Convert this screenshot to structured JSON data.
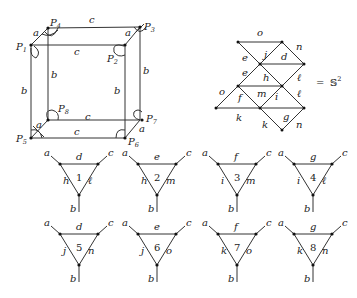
{
  "cube": {
    "points": [
      "P1",
      "P2",
      "P3",
      "P4",
      "P5",
      "P6",
      "P7",
      "P8"
    ],
    "edge_labels": {
      "top_back": "c",
      "top_front": "c",
      "bottom_back": "c",
      "bottom_front": "c",
      "left_front": "b",
      "left_back": "b",
      "right_front": "b",
      "right_back": "b",
      "corner_a": "a"
    }
  },
  "complex": {
    "labels": [
      "o",
      "n",
      "j",
      "d",
      "e",
      "e",
      "h",
      "ℓ",
      "ℓ",
      "o",
      "m",
      "i",
      "f",
      "k",
      "g",
      "k",
      "n"
    ],
    "equals": "=",
    "sphere": "𝕊",
    "sphere_exp": "2"
  },
  "triangles": [
    {
      "num": "1",
      "top": "d",
      "left": "h",
      "right": "ℓ",
      "a": "a",
      "b": "b",
      "c": "c"
    },
    {
      "num": "2",
      "top": "e",
      "left": "h",
      "right": "m",
      "a": "a",
      "b": "b",
      "c": "c"
    },
    {
      "num": "3",
      "top": "f",
      "left": "i",
      "right": "m",
      "a": "a",
      "b": "b",
      "c": "c"
    },
    {
      "num": "4",
      "top": "g",
      "left": "i",
      "right": "ℓ",
      "a": "a",
      "b": "b",
      "c": "c"
    },
    {
      "num": "5",
      "top": "d",
      "left": "j",
      "right": "n",
      "a": "a",
      "b": "b",
      "c": "c"
    },
    {
      "num": "6",
      "top": "e",
      "left": "j",
      "right": "o",
      "a": "a",
      "b": "b",
      "c": "c"
    },
    {
      "num": "7",
      "top": "f",
      "left": "k",
      "right": "o",
      "a": "a",
      "b": "b",
      "c": "c"
    },
    {
      "num": "8",
      "top": "g",
      "left": "k",
      "right": "n",
      "a": "a",
      "b": "b",
      "c": "c"
    }
  ]
}
